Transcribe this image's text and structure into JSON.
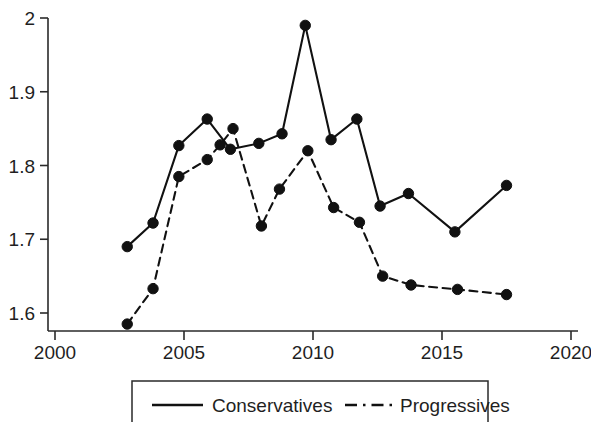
{
  "chart_data": {
    "type": "line",
    "title": "",
    "subtitle": "",
    "xlabel": "",
    "ylabel": "",
    "xlim": [
      2000,
      2020
    ],
    "ylim": [
      1.6,
      2.0
    ],
    "grid": false,
    "legend_position": "bottom",
    "x_ticks": [
      2000,
      2005,
      2010,
      2015,
      2020
    ],
    "x_tick_labels": [
      "2000",
      "2005",
      "2010",
      "2015",
      "2020"
    ],
    "y_ticks": [
      1.6,
      1.7,
      1.8,
      1.9,
      2.0
    ],
    "y_tick_labels": [
      "1.6",
      "1.7",
      "1.8",
      "1.9",
      "2"
    ],
    "series": [
      {
        "name": "Conservatives",
        "style": "solid",
        "color": "#111111",
        "marker": "circle",
        "points": [
          {
            "x": 2002.8,
            "y": 1.69
          },
          {
            "x": 2003.8,
            "y": 1.722
          },
          {
            "x": 2004.8,
            "y": 1.827
          },
          {
            "x": 2005.9,
            "y": 1.863
          },
          {
            "x": 2006.8,
            "y": 1.822
          },
          {
            "x": 2007.9,
            "y": 1.83
          },
          {
            "x": 2008.8,
            "y": 1.843
          },
          {
            "x": 2009.7,
            "y": 1.99
          },
          {
            "x": 2010.7,
            "y": 1.835
          },
          {
            "x": 2011.7,
            "y": 1.863
          },
          {
            "x": 2012.6,
            "y": 1.745
          },
          {
            "x": 2013.7,
            "y": 1.762
          },
          {
            "x": 2015.5,
            "y": 1.71
          },
          {
            "x": 2017.5,
            "y": 1.773
          }
        ]
      },
      {
        "name": "Progressives",
        "style": "dashed",
        "color": "#111111",
        "marker": "circle",
        "points": [
          {
            "x": 2002.8,
            "y": 1.585
          },
          {
            "x": 2003.8,
            "y": 1.633
          },
          {
            "x": 2004.8,
            "y": 1.785
          },
          {
            "x": 2005.9,
            "y": 1.808
          },
          {
            "x": 2006.4,
            "y": 1.828
          },
          {
            "x": 2006.9,
            "y": 1.85
          },
          {
            "x": 2008.0,
            "y": 1.718
          },
          {
            "x": 2008.7,
            "y": 1.768
          },
          {
            "x": 2009.8,
            "y": 1.82
          },
          {
            "x": 2010.8,
            "y": 1.743
          },
          {
            "x": 2011.8,
            "y": 1.723
          },
          {
            "x": 2012.7,
            "y": 1.65
          },
          {
            "x": 2013.8,
            "y": 1.638
          },
          {
            "x": 2015.6,
            "y": 1.632
          },
          {
            "x": 2017.5,
            "y": 1.625
          }
        ]
      }
    ]
  },
  "legend": {
    "items": [
      {
        "label": "Conservatives",
        "style": "solid"
      },
      {
        "label": "Progressives",
        "style": "dashed"
      }
    ]
  }
}
